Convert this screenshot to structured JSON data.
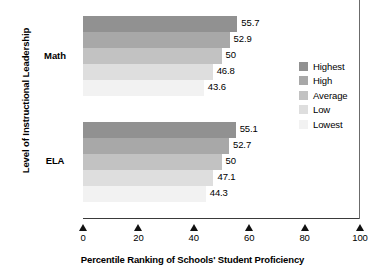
{
  "chart_data": {
    "type": "bar",
    "orientation": "horizontal",
    "title": "",
    "xlabel": "Percentile Ranking of Schools' Student Proficiency",
    "ylabel": "Level of Instructional Leadership",
    "categories": [
      "Math",
      "ELA"
    ],
    "series": [
      {
        "name": "Highest",
        "color": "#919191",
        "values": [
          55.7,
          55.1
        ]
      },
      {
        "name": "High",
        "color": "#a8a8a8",
        "values": [
          52.9,
          52.7
        ]
      },
      {
        "name": "Average",
        "color": "#c2c2c2",
        "values": [
          50,
          50
        ]
      },
      {
        "name": "Low",
        "color": "#dedede",
        "values": [
          46.8,
          47.1
        ]
      },
      {
        "name": "Lowest",
        "color": "#f2f2f2",
        "values": [
          43.6,
          44.3
        ]
      }
    ],
    "value_labels": {
      "Math": [
        "55.7",
        "52.9",
        "50",
        "46.8",
        "43.6"
      ],
      "ELA": [
        "55.1",
        "52.7",
        "50",
        "47.1",
        "44.3"
      ]
    },
    "xlim": [
      0,
      100
    ],
    "xticks": [
      0,
      20,
      40,
      60,
      80,
      100
    ],
    "xtick_labels": [
      "0",
      "20",
      "40",
      "60",
      "80",
      "100"
    ],
    "grid": false,
    "legend_position": "right",
    "legend_entries": [
      "Highest",
      "High",
      "Average",
      "Low",
      "Lowest"
    ]
  },
  "axis": {
    "x_title": "Percentile Ranking of Schools' Student Proficiency",
    "y_title": "Level of Instructional Leadership",
    "ticks": [
      {
        "label": "0"
      },
      {
        "label": "20"
      },
      {
        "label": "40"
      },
      {
        "label": "60"
      },
      {
        "label": "80"
      },
      {
        "label": "100"
      }
    ]
  },
  "groups": [
    {
      "label": "Math",
      "bars": [
        {
          "series": "Highest",
          "value": 55.7,
          "label": "55.7"
        },
        {
          "series": "High",
          "value": 52.9,
          "label": "52.9"
        },
        {
          "series": "Average",
          "value": 50,
          "label": "50"
        },
        {
          "series": "Low",
          "value": 46.8,
          "label": "46.8"
        },
        {
          "series": "Lowest",
          "value": 43.6,
          "label": "43.6"
        }
      ]
    },
    {
      "label": "ELA",
      "bars": [
        {
          "series": "Highest",
          "value": 55.1,
          "label": "55.1"
        },
        {
          "series": "High",
          "value": 52.7,
          "label": "52.7"
        },
        {
          "series": "Average",
          "value": 50,
          "label": "50"
        },
        {
          "series": "Low",
          "value": 47.1,
          "label": "47.1"
        },
        {
          "series": "Lowest",
          "value": 44.3,
          "label": "44.3"
        }
      ]
    }
  ],
  "legend": {
    "items": [
      {
        "label": "Highest",
        "color": "#919191"
      },
      {
        "label": "High",
        "color": "#a8a8a8"
      },
      {
        "label": "Average",
        "color": "#c2c2c2"
      },
      {
        "label": "Low",
        "color": "#dedede"
      },
      {
        "label": "Lowest",
        "color": "#f2f2f2"
      }
    ]
  }
}
